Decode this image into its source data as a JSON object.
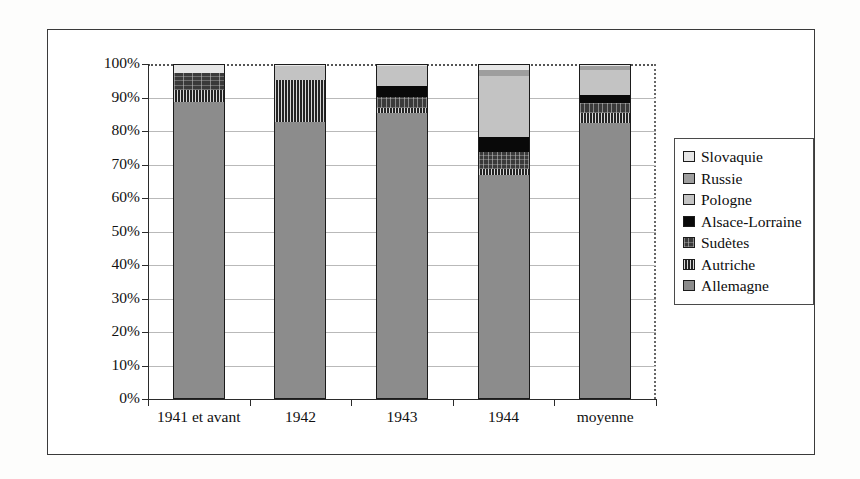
{
  "chart_data": {
    "type": "bar",
    "subtype": "stacked-100-percent",
    "title": "",
    "xlabel": "",
    "ylabel": "",
    "ylim": [
      0,
      100
    ],
    "ytick_labels": [
      "0%",
      "10%",
      "20%",
      "30%",
      "40%",
      "50%",
      "60%",
      "70%",
      "80%",
      "90%",
      "100%"
    ],
    "ytick_values": [
      0,
      10,
      20,
      30,
      40,
      50,
      60,
      70,
      80,
      90,
      100
    ],
    "grid": true,
    "legend_position": "right",
    "categories": [
      "1941 et avant",
      "1942",
      "1943",
      "1944",
      "moyenne"
    ],
    "series": [
      {
        "name": "Allemagne",
        "pattern": "solid-gray",
        "values": [
          88.5,
          82.5,
          85.0,
          66.5,
          82.0
        ]
      },
      {
        "name": "Autriche",
        "pattern": "vertical-hatch",
        "values": [
          3.5,
          12.5,
          1.5,
          2.0,
          3.0
        ]
      },
      {
        "name": "Sudètes",
        "pattern": "cross-hatch-dark",
        "values": [
          5.0,
          0.0,
          3.5,
          5.0,
          3.0
        ]
      },
      {
        "name": "Alsace-Lorraine",
        "pattern": "solid-black",
        "values": [
          0.0,
          0.0,
          3.0,
          4.5,
          2.5
        ]
      },
      {
        "name": "Pologne",
        "pattern": "light-dots",
        "values": [
          0.0,
          4.0,
          6.0,
          18.0,
          7.5
        ]
      },
      {
        "name": "Russie",
        "pattern": "medium-dots",
        "values": [
          0.0,
          0.0,
          0.0,
          2.0,
          1.0
        ]
      },
      {
        "name": "Slovaquie",
        "pattern": "very-light-dots",
        "values": [
          3.0,
          1.0,
          1.0,
          2.0,
          1.0
        ]
      }
    ],
    "stack_order_bottom_to_top": [
      "Allemagne",
      "Autriche",
      "Sudètes",
      "Alsace-Lorraine",
      "Pologne",
      "Russie",
      "Slovaquie"
    ]
  },
  "legend": {
    "items": [
      {
        "label": "Slovaquie",
        "swatch": "very-light-dots"
      },
      {
        "label": "Russie",
        "swatch": "medium-dots"
      },
      {
        "label": "Pologne",
        "swatch": "light-dots"
      },
      {
        "label": "Alsace-Lorraine",
        "swatch": "solid-black"
      },
      {
        "label": "Sudètes",
        "swatch": "cross-hatch-dark"
      },
      {
        "label": "Autriche",
        "swatch": "vertical-hatch"
      },
      {
        "label": "Allemagne",
        "swatch": "solid-gray"
      }
    ]
  },
  "colors": {
    "allemagne": "#8c8c8c",
    "autriche": "#2e2e2e",
    "sudetes": "#3a3a3a",
    "alsace_lorraine": "#090909",
    "pologne": "#c3c3c3",
    "russie": "#9e9e9e",
    "slovaquie": "#e6e6e6",
    "axis": "#2b2b2b",
    "grid": "#b9b9b9",
    "background": "#ffffff"
  }
}
